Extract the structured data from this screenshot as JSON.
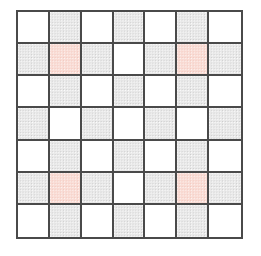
{
  "figure": {
    "rows": 7,
    "columns": 7,
    "cell_label": "grid-cell"
  },
  "colors": {
    "white": "#ffffff",
    "gray": "#e9e9e9",
    "pink": "#f9dcd5",
    "gridline": "#4a4a4a",
    "background": "#ffffff"
  },
  "legend": {
    "white_name": "empty",
    "gray_name": "shaded",
    "pink_name": "highlighted"
  },
  "chart_data": {
    "type": "heatmap",
    "xlabel": "",
    "ylabel": "",
    "categories_x": [
      "1",
      "2",
      "3",
      "4",
      "5",
      "6",
      "7"
    ],
    "categories_y": [
      "1",
      "2",
      "3",
      "4",
      "5",
      "6",
      "7"
    ],
    "value_names": {
      "0": "white",
      "1": "gray",
      "2": "pink"
    },
    "color_map": {
      "white": "#ffffff",
      "gray": "#e9e9e9",
      "pink": "#f9dcd5"
    },
    "grid": true,
    "legend": "none",
    "highlighted_cells": [
      {
        "row": 2,
        "col": 2
      },
      {
        "row": 2,
        "col": 6
      },
      {
        "row": 6,
        "col": 2
      },
      {
        "row": 6,
        "col": 6
      }
    ],
    "values": [
      [
        "white",
        "gray",
        "white",
        "gray",
        "white",
        "gray",
        "white"
      ],
      [
        "gray",
        "pink",
        "gray",
        "white",
        "gray",
        "pink",
        "gray"
      ],
      [
        "white",
        "gray",
        "white",
        "gray",
        "white",
        "gray",
        "white"
      ],
      [
        "gray",
        "white",
        "gray",
        "white",
        "gray",
        "white",
        "gray"
      ],
      [
        "white",
        "gray",
        "white",
        "gray",
        "white",
        "gray",
        "white"
      ],
      [
        "gray",
        "pink",
        "gray",
        "white",
        "gray",
        "pink",
        "gray"
      ],
      [
        "white",
        "gray",
        "white",
        "gray",
        "white",
        "gray",
        "white"
      ]
    ]
  }
}
